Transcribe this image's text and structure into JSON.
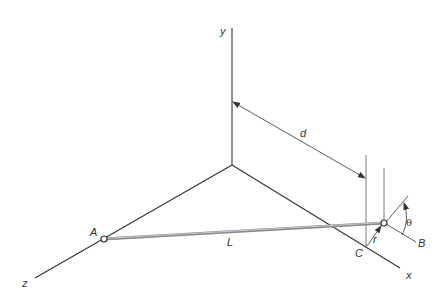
{
  "diagram": {
    "labels": {
      "y_axis": "y",
      "x_axis": "x",
      "z_axis": "z",
      "point_A": "A",
      "point_B": "B",
      "point_C": "C",
      "length_L": "L",
      "distance_d": "d",
      "radius_r": "r",
      "angle_theta": "θ"
    },
    "colors": {
      "lines": "#333333",
      "rod": "#8a8a8a",
      "rod_highlight": "#c8c8d8"
    }
  }
}
